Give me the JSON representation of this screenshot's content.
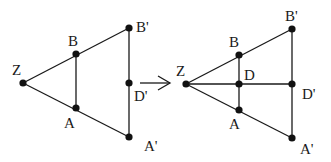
{
  "diagram": {
    "type": "geometry-transformation",
    "arrow_label": "",
    "colors": {
      "line": "#1a1a1a",
      "point": "#111111",
      "background": "#ffffff"
    },
    "left": {
      "points": [
        {
          "id": "Z",
          "label": "Z",
          "x": 23,
          "y": 83,
          "lx": 12,
          "ly": 75
        },
        {
          "id": "B",
          "label": "B",
          "x": 76,
          "y": 54,
          "lx": 68,
          "ly": 46
        },
        {
          "id": "A",
          "label": "A",
          "x": 76,
          "y": 108,
          "lx": 64,
          "ly": 128
        },
        {
          "id": "B2",
          "label": "B'",
          "x": 129,
          "y": 28,
          "lx": 136,
          "ly": 32
        },
        {
          "id": "D2",
          "label": "D'",
          "x": 129,
          "y": 83,
          "lx": 134,
          "ly": 101
        },
        {
          "id": "A2",
          "label": "A'",
          "x": 129,
          "y": 137,
          "lx": 144,
          "ly": 151
        }
      ],
      "segments": [
        [
          "Z",
          "B2"
        ],
        [
          "Z",
          "A2"
        ],
        [
          "B",
          "A"
        ],
        [
          "B2",
          "A2"
        ]
      ]
    },
    "right": {
      "points": [
        {
          "id": "Z",
          "label": "Z",
          "x": 186,
          "y": 84,
          "lx": 176,
          "ly": 76
        },
        {
          "id": "B",
          "label": "B",
          "x": 239,
          "y": 55,
          "lx": 229,
          "ly": 47
        },
        {
          "id": "D",
          "label": "D",
          "x": 239,
          "y": 84,
          "lx": 244,
          "ly": 80
        },
        {
          "id": "A",
          "label": "A",
          "x": 239,
          "y": 110,
          "lx": 229,
          "ly": 129
        },
        {
          "id": "B2",
          "label": "B'",
          "x": 292,
          "y": 29,
          "lx": 285,
          "ly": 21
        },
        {
          "id": "D2",
          "label": "D'",
          "x": 292,
          "y": 84,
          "lx": 302,
          "ly": 99
        },
        {
          "id": "A2",
          "label": "A'",
          "x": 292,
          "y": 138,
          "lx": 300,
          "ly": 154
        }
      ],
      "segments": [
        [
          "Z",
          "B2"
        ],
        [
          "Z",
          "A2"
        ],
        [
          "Z",
          "D2"
        ],
        [
          "B",
          "A"
        ],
        [
          "B2",
          "A2"
        ]
      ]
    },
    "arrow": {
      "x1": 140,
      "y1": 83,
      "x2": 170,
      "y2": 83
    }
  }
}
